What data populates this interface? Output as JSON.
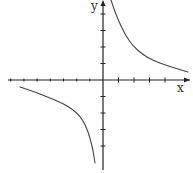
{
  "chart_data": {
    "type": "line",
    "title": "",
    "xlabel": "x",
    "ylabel": "y",
    "function": "y = k/x (hyperbola, k > 0)",
    "grid": false,
    "legend": null,
    "x_ticks_count_positive": 4,
    "x_ticks_count_negative": 7,
    "y_ticks_count_positive": 4,
    "y_ticks_count_negative": 4,
    "series": [
      {
        "name": "branch-quadrant-I",
        "points_px": [
          [
            111,
            0
          ],
          [
            115,
            12
          ],
          [
            120,
            24
          ],
          [
            126,
            36
          ],
          [
            133,
            46
          ],
          [
            142,
            54
          ],
          [
            152,
            60
          ],
          [
            165,
            65
          ],
          [
            178,
            69
          ],
          [
            188,
            72
          ]
        ]
      },
      {
        "name": "branch-quadrant-III",
        "points_px": [
          [
            20,
            87
          ],
          [
            35,
            92
          ],
          [
            50,
            98
          ],
          [
            62,
            103
          ],
          [
            72,
            109
          ],
          [
            80,
            116
          ],
          [
            86,
            126
          ],
          [
            90,
            138
          ],
          [
            93,
            150
          ],
          [
            95,
            163
          ]
        ]
      }
    ],
    "colors": {
      "axis": "#222222",
      "curve": "#444444"
    }
  },
  "labels": {
    "x": "x",
    "y": "y"
  }
}
